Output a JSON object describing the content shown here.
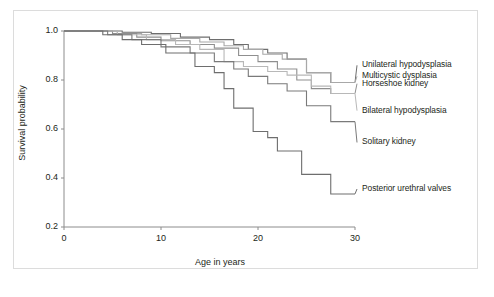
{
  "figure": {
    "background_color": "#ffffff",
    "border_color": "#dcdcdc"
  },
  "chart_data": {
    "type": "line",
    "subtype": "kaplan-meier-step",
    "title": "",
    "xlabel": "Age in years",
    "ylabel": "Survival probability",
    "xlim": [
      0,
      30
    ],
    "ylim": [
      0.2,
      1.0
    ],
    "xticks": [
      0,
      10,
      20,
      30
    ],
    "xtick_labels": [
      "0",
      "10",
      "20",
      "30"
    ],
    "yticks": [
      0.2,
      0.4,
      0.6,
      0.8,
      1.0
    ],
    "ytick_labels": [
      "0.2",
      "0.4",
      "0.6",
      "0.8",
      "1.0"
    ],
    "grid": false,
    "legend_position": "right-inline",
    "series": [
      {
        "name": "Unilateral hypodysplasia",
        "color": "#6e6e6e",
        "label_y": 0.86,
        "final_value": 0.79,
        "points": [
          [
            0,
            1.0
          ],
          [
            6,
            1.0
          ],
          [
            6,
            0.995
          ],
          [
            9,
            0.995
          ],
          [
            9,
            0.99
          ],
          [
            12,
            0.99
          ],
          [
            12,
            0.975
          ],
          [
            15,
            0.975
          ],
          [
            15,
            0.965
          ],
          [
            17.5,
            0.965
          ],
          [
            17.5,
            0.945
          ],
          [
            19,
            0.945
          ],
          [
            19,
            0.925
          ],
          [
            21,
            0.925
          ],
          [
            21,
            0.91
          ],
          [
            23,
            0.91
          ],
          [
            23,
            0.885
          ],
          [
            25,
            0.885
          ],
          [
            25,
            0.83
          ],
          [
            27.5,
            0.83
          ],
          [
            27.5,
            0.79
          ],
          [
            30,
            0.79
          ]
        ]
      },
      {
        "name": "Multicystic dysplasia",
        "color": "#a8a8a8",
        "label_y": 0.815,
        "final_value": 0.79,
        "points": [
          [
            0,
            1.0
          ],
          [
            5.5,
            1.0
          ],
          [
            5.5,
            0.99
          ],
          [
            8,
            0.99
          ],
          [
            8,
            0.985
          ],
          [
            11,
            0.985
          ],
          [
            11,
            0.97
          ],
          [
            14,
            0.97
          ],
          [
            14,
            0.955
          ],
          [
            16.5,
            0.955
          ],
          [
            16.5,
            0.94
          ],
          [
            18.5,
            0.94
          ],
          [
            18.5,
            0.925
          ],
          [
            20.5,
            0.925
          ],
          [
            20.5,
            0.905
          ],
          [
            22.5,
            0.905
          ],
          [
            22.5,
            0.885
          ],
          [
            25,
            0.885
          ],
          [
            25,
            0.83
          ],
          [
            27.5,
            0.83
          ],
          [
            27.5,
            0.79
          ],
          [
            30,
            0.79
          ]
        ]
      },
      {
        "name": "Horseshoe kidney",
        "color": "#8f8f8f",
        "label_y": 0.785,
        "final_value": 0.745,
        "points": [
          [
            0,
            1.0
          ],
          [
            5,
            1.0
          ],
          [
            5,
            0.99
          ],
          [
            7.5,
            0.99
          ],
          [
            7.5,
            0.975
          ],
          [
            10,
            0.975
          ],
          [
            10,
            0.96
          ],
          [
            13,
            0.96
          ],
          [
            13,
            0.945
          ],
          [
            15.5,
            0.945
          ],
          [
            15.5,
            0.93
          ],
          [
            18,
            0.93
          ],
          [
            18,
            0.9
          ],
          [
            20,
            0.9
          ],
          [
            20,
            0.875
          ],
          [
            22,
            0.875
          ],
          [
            22,
            0.845
          ],
          [
            24,
            0.845
          ],
          [
            24,
            0.8
          ],
          [
            25.5,
            0.8
          ],
          [
            25.5,
            0.765
          ],
          [
            27.5,
            0.765
          ],
          [
            27.5,
            0.745
          ],
          [
            30,
            0.745
          ]
        ]
      },
      {
        "name": "Bilateral hypodysplasia",
        "color": "#b8b8b8",
        "label_y": 0.675,
        "final_value": 0.745,
        "points": [
          [
            0,
            1.0
          ],
          [
            5.5,
            1.0
          ],
          [
            5.5,
            0.985
          ],
          [
            8.5,
            0.985
          ],
          [
            8.5,
            0.965
          ],
          [
            11.5,
            0.965
          ],
          [
            11.5,
            0.945
          ],
          [
            14,
            0.945
          ],
          [
            14,
            0.925
          ],
          [
            16.5,
            0.925
          ],
          [
            16.5,
            0.875
          ],
          [
            18.5,
            0.875
          ],
          [
            18.5,
            0.855
          ],
          [
            21,
            0.855
          ],
          [
            21,
            0.835
          ],
          [
            23,
            0.835
          ],
          [
            23,
            0.82
          ],
          [
            25.5,
            0.82
          ],
          [
            25.5,
            0.775
          ],
          [
            27.5,
            0.775
          ],
          [
            27.5,
            0.745
          ],
          [
            30,
            0.745
          ]
        ]
      },
      {
        "name": "Solitary kidney",
        "color": "#7a7a7a",
        "label_y": 0.545,
        "final_value": 0.63,
        "points": [
          [
            0,
            1.0
          ],
          [
            4.5,
            1.0
          ],
          [
            4.5,
            0.985
          ],
          [
            7,
            0.985
          ],
          [
            7,
            0.965
          ],
          [
            10,
            0.965
          ],
          [
            10,
            0.935
          ],
          [
            13,
            0.935
          ],
          [
            13,
            0.91
          ],
          [
            15.5,
            0.91
          ],
          [
            15.5,
            0.875
          ],
          [
            17.5,
            0.875
          ],
          [
            17.5,
            0.845
          ],
          [
            19,
            0.845
          ],
          [
            19,
            0.815
          ],
          [
            21,
            0.815
          ],
          [
            21,
            0.785
          ],
          [
            23,
            0.785
          ],
          [
            23,
            0.755
          ],
          [
            25,
            0.755
          ],
          [
            25,
            0.695
          ],
          [
            27.5,
            0.695
          ],
          [
            27.5,
            0.63
          ],
          [
            30,
            0.63
          ]
        ]
      },
      {
        "name": "Posterior urethral valves",
        "color": "#6e6e6e",
        "label_y": 0.355,
        "final_value": 0.335,
        "points": [
          [
            0,
            1.0
          ],
          [
            4,
            1.0
          ],
          [
            4,
            0.985
          ],
          [
            6,
            0.985
          ],
          [
            6,
            0.965
          ],
          [
            8,
            0.965
          ],
          [
            8,
            0.945
          ],
          [
            10.5,
            0.945
          ],
          [
            10.5,
            0.91
          ],
          [
            13.5,
            0.91
          ],
          [
            13.5,
            0.855
          ],
          [
            15.5,
            0.855
          ],
          [
            15.5,
            0.83
          ],
          [
            16.5,
            0.83
          ],
          [
            16.5,
            0.765
          ],
          [
            17.5,
            0.765
          ],
          [
            17.5,
            0.685
          ],
          [
            19.5,
            0.685
          ],
          [
            19.5,
            0.59
          ],
          [
            21,
            0.59
          ],
          [
            21,
            0.565
          ],
          [
            22,
            0.565
          ],
          [
            22,
            0.51
          ],
          [
            24.5,
            0.51
          ],
          [
            24.5,
            0.415
          ],
          [
            27.5,
            0.415
          ],
          [
            27.5,
            0.335
          ],
          [
            30,
            0.335
          ]
        ]
      }
    ]
  },
  "axis": {
    "line_color": "#8c8c8c"
  }
}
